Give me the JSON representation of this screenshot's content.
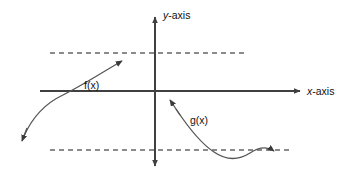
{
  "figure": {
    "background_color": "#ffffff",
    "axis_color": "#404040",
    "curve_color": "#555555",
    "asymptote_color": "#666666",
    "label_color": "#111111"
  },
  "axes": {
    "x_axis": {
      "label_prefix": "x",
      "label_suffix": "-axis",
      "label_full": "x-axis",
      "orientation": "horizontal",
      "arrowheads": "right"
    },
    "y_axis": {
      "label_prefix": "y",
      "label_suffix": "-axis",
      "label_full": "y-axis",
      "orientation": "vertical",
      "arrowheads": "both"
    },
    "origin": {
      "x": 155,
      "y": 91
    }
  },
  "asymptotes": [
    {
      "name": "upper-asymptote",
      "style": "dashed",
      "y": 53,
      "x_start": 50,
      "x_end": 246,
      "associated_function": "f(x)"
    },
    {
      "name": "lower-asymptote",
      "style": "dashed",
      "y": 150,
      "x_start": 50,
      "x_end": 292,
      "associated_function": "g(x)"
    }
  ],
  "curves": [
    {
      "name": "f-curve",
      "label": "f(x)",
      "label_x": 84,
      "label_y": 89,
      "description": "Increasing concave-down curve rising from lower left, crossing the x-axis, approaching the upper dashed asymptote from below",
      "arrowheads": [
        "lower-left-down",
        "upper-right"
      ],
      "path": "M 22 139 C 30 120 44 104 62 95 C 84 84 106 70 124 61"
    },
    {
      "name": "g-curve",
      "label": "g(x)",
      "label_x": 190,
      "label_y": 124,
      "description": "Curve descending steeply from upper left, dipping below the lower dashed asymptote, then rising to approach it from below",
      "arrowheads": [
        "upper-left",
        "right"
      ],
      "path": "M 171 101 C 185 124 198 142 213 152 C 226 161 238 161 249 154 C 258 148 266 146 276 151"
    }
  ]
}
